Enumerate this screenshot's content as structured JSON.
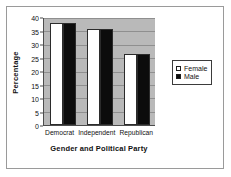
{
  "chart_data": {
    "type": "bar",
    "title": "",
    "subtitle": "",
    "categories": [
      "Democrat",
      "Independent",
      "Republican"
    ],
    "series": [
      {
        "name": "Female",
        "values": [
          38,
          36,
          26.5
        ],
        "color": "#ffffff"
      },
      {
        "name": "Male",
        "values": [
          38,
          36,
          26.5
        ],
        "color": "#000000"
      }
    ],
    "xlabel": "Gender and Political Party",
    "ylabel": "Percentage",
    "ylim": [
      0,
      40
    ],
    "ytick_step": 5,
    "yticks": [
      0,
      5,
      10,
      15,
      20,
      25,
      30,
      35,
      40
    ],
    "ytick_labels": [
      "0",
      "5",
      "10",
      "15",
      "20",
      "25",
      "30",
      "35",
      "40"
    ],
    "grid": true,
    "grid_axis": "y",
    "legend_position": "right",
    "plot_background": "#b9b9b9",
    "figure_background": "#ffffff",
    "axis_color": "#4c4c4c",
    "gridline_color": "#8f8f8f"
  },
  "legend": {
    "entries": [
      {
        "label": "Female",
        "swatch": "hollow-square-swatch"
      },
      {
        "label": "Male",
        "swatch": "filled-square-swatch"
      }
    ]
  }
}
